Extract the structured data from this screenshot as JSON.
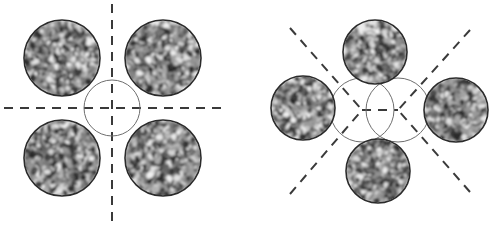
{
  "figure": {
    "title": "Beam-spot packing arrangements with speckle texture",
    "width": 493,
    "height": 226,
    "background_color": "#ffffff",
    "panel_count": 2
  },
  "style": {
    "circle_stroke_color": "#2b2b2b",
    "circle_stroke_width": 1.6,
    "guide_circle_stroke_color": "#6e6e6e",
    "guide_circle_stroke_width": 1.0,
    "dash_color": "#3a3a3a",
    "dash_width": 2.0,
    "dash_pattern": "9 7",
    "texture_light": "#f2f2f2",
    "texture_mid": "#9a9a9a",
    "texture_dark": "#2a2a2a"
  },
  "panels": [
    {
      "id": "left-panel",
      "name": "square-arrangement",
      "arrangement": "2x2 square packing",
      "spot_radius": 38,
      "guide_circles": [
        {
          "name": "center-guide-circle",
          "cx": 112,
          "cy": 108,
          "r": 28
        }
      ],
      "spots": [
        {
          "name": "spot-top-left",
          "cx": 62,
          "cy": 58,
          "r": 38,
          "seed": 11
        },
        {
          "name": "spot-top-right",
          "cx": 163,
          "cy": 58,
          "r": 38,
          "seed": 23
        },
        {
          "name": "spot-bottom-left",
          "cx": 62,
          "cy": 158,
          "r": 38,
          "seed": 37
        },
        {
          "name": "spot-bottom-right",
          "cx": 163,
          "cy": 158,
          "r": 38,
          "seed": 53
        }
      ],
      "axes": [
        {
          "name": "horizontal-axis",
          "x1": 4,
          "y1": 108,
          "x2": 228,
          "y2": 108
        },
        {
          "name": "vertical-axis",
          "x1": 112,
          "y1": 4,
          "x2": 112,
          "y2": 222
        }
      ]
    },
    {
      "id": "right-panel",
      "name": "diamond-arrangement",
      "arrangement": "4-fold diamond packing",
      "spot_radius": 32,
      "guide_circles": [
        {
          "name": "center-guide-circle-left",
          "cx": 362,
          "cy": 110,
          "r": 32
        },
        {
          "name": "center-guide-circle-right",
          "cx": 398,
          "cy": 110,
          "r": 32
        }
      ],
      "spots": [
        {
          "name": "spot-top",
          "cx": 375,
          "cy": 52,
          "r": 32,
          "seed": 71
        },
        {
          "name": "spot-left",
          "cx": 303,
          "cy": 108,
          "r": 32,
          "seed": 89
        },
        {
          "name": "spot-right",
          "cx": 456,
          "cy": 110,
          "r": 32,
          "seed": 101
        },
        {
          "name": "spot-bottom",
          "cx": 378,
          "cy": 171,
          "r": 32,
          "seed": 113
        }
      ],
      "axes": [
        {
          "name": "diagonal-axis-upper-left",
          "x1": 290,
          "y1": 28,
          "x2": 362,
          "y2": 110
        },
        {
          "name": "diagonal-axis-upper-right",
          "x1": 470,
          "y1": 30,
          "x2": 398,
          "y2": 110
        },
        {
          "name": "diagonal-axis-lower-left",
          "x1": 290,
          "y1": 194,
          "x2": 362,
          "y2": 110
        },
        {
          "name": "diagonal-axis-lower-right",
          "x1": 470,
          "y1": 192,
          "x2": 398,
          "y2": 110
        },
        {
          "name": "horizontal-center-segment",
          "x1": 362,
          "y1": 110,
          "x2": 398,
          "y2": 110
        }
      ]
    }
  ]
}
